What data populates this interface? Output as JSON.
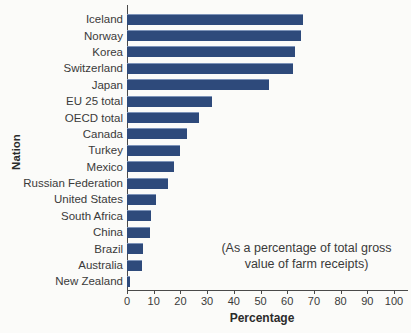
{
  "figure": {
    "annotation_line1": "(As a percentage of total gross",
    "annotation_line2": "value of farm receipts)"
  },
  "colors": {
    "bar": "#2e4a7b",
    "axis": "#4a4a4a",
    "text": "#3a3a3a"
  },
  "chart_data": {
    "type": "bar",
    "orientation": "horizontal",
    "title": "",
    "xlabel": "Percentage",
    "ylabel": "Nation",
    "xlim": [
      0,
      100
    ],
    "x_ticks": [
      0,
      10,
      20,
      30,
      40,
      50,
      60,
      70,
      80,
      90,
      100
    ],
    "grid": false,
    "annotation": "(As a percentage of total gross value of farm receipts)",
    "categories": [
      "Iceland",
      "Norway",
      "Korea",
      "Switzerland",
      "Japan",
      "EU 25 total",
      "OECD total",
      "Canada",
      "Turkey",
      "Mexico",
      "Russian Federation",
      "United States",
      "South Africa",
      "China",
      "Brazil",
      "Australia",
      "New Zealand"
    ],
    "values": [
      66,
      65,
      63,
      62,
      53,
      32,
      27,
      22.5,
      20,
      17.5,
      15.5,
      11,
      9,
      8.5,
      6,
      5.5,
      1
    ]
  }
}
